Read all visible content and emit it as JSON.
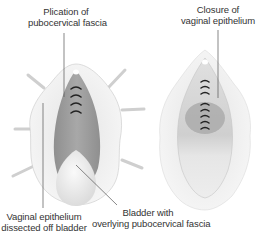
{
  "figure": {
    "left_panel": {
      "name": "dissection",
      "labels": {
        "top": [
          "Plication of",
          "pubocervical fascia"
        ],
        "bottom_left": [
          "Vaginal epithelium",
          "dissected off bladder"
        ],
        "bottom_right": [
          "Bladder with",
          "overlying pubocervical fascia"
        ]
      },
      "plication_sutures": 4
    },
    "right_panel": {
      "name": "closure",
      "labels": {
        "top": [
          "Closure of",
          "vaginal epithelium"
        ]
      },
      "closure_sutures": 9
    },
    "colors": {
      "fascia": "#9a9a9a",
      "bladder": "#ececec",
      "tissue_outer": "#f2f2f2",
      "epithelium": "#d9d9d9",
      "suture": "#222222",
      "leader_line": "#555555",
      "text": "#333333"
    }
  }
}
